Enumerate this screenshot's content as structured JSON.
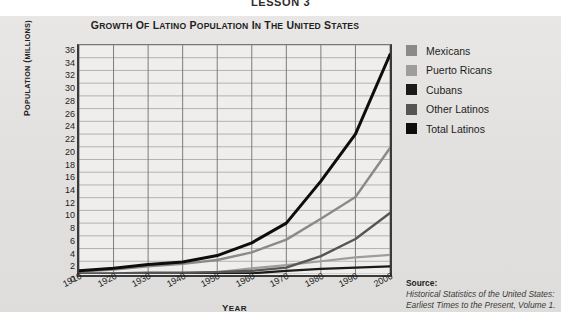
{
  "lesson_header": "LESSON 3",
  "chart_title": "GROWTH OF LATINO POPULATION IN THE UNITED STATES",
  "axes": {
    "ylabel": "POPULATION (MILLIONS)",
    "xlabel": "YEAR",
    "yticks": [
      "36",
      "34",
      "32",
      "30",
      "28",
      "26",
      "24",
      "22",
      "20",
      "18",
      "16",
      "14",
      "12",
      "10",
      "8",
      "6",
      "4",
      "2",
      "0"
    ],
    "xticks": [
      "1910",
      "1920",
      "1930",
      "1940",
      "1950",
      "1960",
      "1970",
      "1980",
      "1990",
      "2000"
    ]
  },
  "legend": {
    "items": [
      {
        "label": "Mexicans",
        "color": "#8a8a8a"
      },
      {
        "label": "Puerto Ricans",
        "color": "#9d9d9d"
      },
      {
        "label": "Cubans",
        "color": "#1a1a1a"
      },
      {
        "label": "Other Latinos",
        "color": "#555555"
      },
      {
        "label": "Total Latinos",
        "color": "#0d0d0d"
      }
    ]
  },
  "source": {
    "title": "Source:",
    "text": "Historical Statistics of the United States: Earliest Times to the Present, Volume 1."
  },
  "chart_data": {
    "type": "line",
    "title": "GROWTH OF LATINO POPULATION IN THE UNITED STATES",
    "xlabel": "YEAR",
    "ylabel": "POPULATION (MILLIONS)",
    "x": [
      1910,
      1920,
      1930,
      1940,
      1950,
      1960,
      1970,
      1980,
      1990,
      2000
    ],
    "xlim": [
      1910,
      2000
    ],
    "ylim": [
      0,
      36
    ],
    "ytick_step": 2,
    "grid": true,
    "legend_position": "right",
    "series": [
      {
        "name": "Mexicans",
        "color": "#8a8a8a",
        "values": [
          0.4,
          0.7,
          1.2,
          1.6,
          2.2,
          3.4,
          5.4,
          8.7,
          12.1,
          19.8
        ]
      },
      {
        "name": "Puerto Ricans",
        "color": "#9d9d9d",
        "values": [
          0.0,
          0.1,
          0.1,
          0.1,
          0.3,
          0.9,
          1.4,
          2.0,
          2.6,
          3.0
        ]
      },
      {
        "name": "Cubans",
        "color": "#1a1a1a",
        "values": [
          0.0,
          0.0,
          0.0,
          0.0,
          0.1,
          0.1,
          0.5,
          0.8,
          1.0,
          1.2
        ]
      },
      {
        "name": "Other Latinos",
        "color": "#555555",
        "values": [
          0.1,
          0.1,
          0.2,
          0.2,
          0.3,
          0.5,
          1.0,
          2.8,
          5.5,
          9.6
        ]
      },
      {
        "name": "Total Latinos",
        "color": "#0d0d0d",
        "values": [
          0.5,
          0.9,
          1.5,
          1.9,
          2.9,
          4.9,
          8.0,
          14.6,
          22.0,
          34.5
        ]
      }
    ]
  }
}
